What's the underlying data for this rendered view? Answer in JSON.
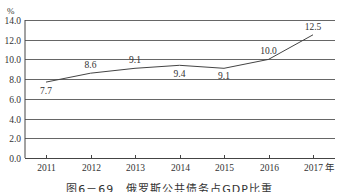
{
  "chart_data": {
    "type": "line",
    "title": "",
    "caption": "图6－69　俄罗斯公共债务占GDP比重",
    "xlabel": "年",
    "ylabel": "%",
    "categories": [
      "2011",
      "2012",
      "2013",
      "2014",
      "2015",
      "2016",
      "2017"
    ],
    "series": [
      {
        "name": "公共债务占GDP比重",
        "values": [
          7.7,
          8.6,
          9.1,
          9.4,
          9.1,
          10.0,
          12.5
        ]
      }
    ],
    "data_labels": [
      "7.7",
      "8.6",
      "9.1",
      "9.4",
      "9.1",
      "10.0",
      "12.5"
    ],
    "ylim": [
      0,
      14
    ],
    "yticks": [
      "0.0",
      "2.0",
      "4.0",
      "6.0",
      "8.0",
      "10.0",
      "12.0",
      "14.0"
    ],
    "grid": true,
    "legend": "none"
  },
  "axis": {
    "y_unit": "%",
    "x_unit": "年"
  },
  "caption": "图6－69　俄罗斯公共债务占GDP比重"
}
